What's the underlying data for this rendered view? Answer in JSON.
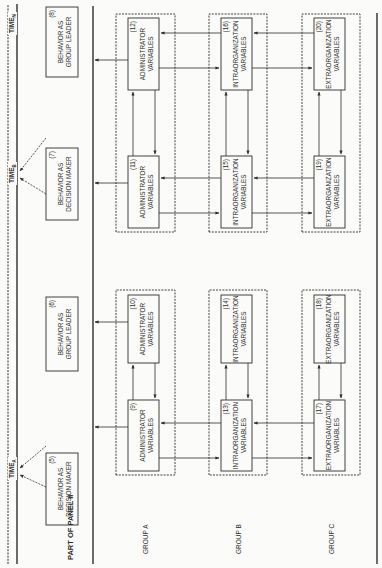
{
  "panel_title": "PART OF PANEL II",
  "timeline": {
    "time_a": "TIME",
    "time_a_sub": "A",
    "time_b": "TIME",
    "time_b_sub": "B",
    "time_n": "TIME",
    "time_n_sub": "N"
  },
  "groups": [
    "GROUP A",
    "GROUP B",
    "GROUP C"
  ],
  "behavior_boxes": [
    {
      "num": "(5)",
      "line1": "BEHAVIOR AS",
      "line2": "DECISION MAKER"
    },
    {
      "num": "(6)",
      "line1": "BEHAVIOR AS",
      "line2": "GROUP LEADER"
    },
    {
      "num": "(7)",
      "line1": "BEHAVIOR AS",
      "line2": "DECISION MAKER"
    },
    {
      "num": "(8)",
      "line1": "BEHAVIOR AS",
      "line2": "GROUP LEADER"
    }
  ],
  "variable_boxes": [
    {
      "num": "(9)",
      "line1": "ADMINISTRATOR",
      "line2": "VARIABLES"
    },
    {
      "num": "(10)",
      "line1": "ADMINISTRATOR",
      "line2": "VARIABLES"
    },
    {
      "num": "(11)",
      "line1": "ADMINISTRATOR",
      "line2": "VARIABLES"
    },
    {
      "num": "(12)",
      "line1": "ADMINISTRATOR",
      "line2": "VARIABLES"
    },
    {
      "num": "(13)",
      "line1": "INTRAORGANIZATION",
      "line2": "VARIABLES"
    },
    {
      "num": "(14)",
      "line1": "INTRAORGANIZATION",
      "line2": "VARIABLES"
    },
    {
      "num": "(15)",
      "line1": "INTRAORGANIZATION",
      "line2": "VARIABLES"
    },
    {
      "num": "(16)",
      "line1": "INTRAORGANIZATION",
      "line2": "VARIABLES"
    },
    {
      "num": "(17)",
      "line1": "EXTRAORGANIZATION",
      "line2": "VARIABLES"
    },
    {
      "num": "(18)",
      "line1": "EXTRAORGANIZATION",
      "line2": "VARIABLES"
    },
    {
      "num": "(19)",
      "line1": "EXTRAORGANIZATION",
      "line2": "VARIABLES"
    },
    {
      "num": "(20)",
      "line1": "EXTRAORGANIZATION",
      "line2": "VARIABLES"
    }
  ],
  "colors": {
    "ink": "#2e2e2e",
    "paper": "#fbfbf9"
  }
}
